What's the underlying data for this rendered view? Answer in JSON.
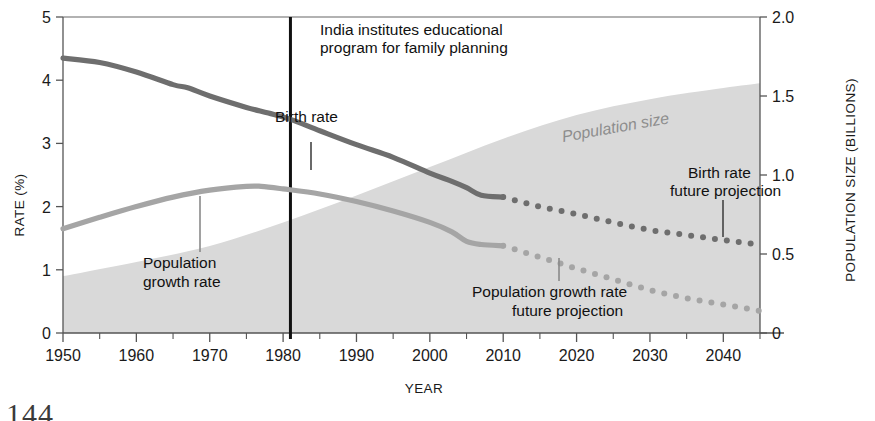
{
  "page": {
    "number": "144"
  },
  "chart_data": {
    "type": "line",
    "title": "",
    "xlabel": "YEAR",
    "ylabel": "RATE (%)",
    "y2label": "POPULATION SIZE (BILLIONS)",
    "xlim": [
      1950,
      2045
    ],
    "ylim": [
      0,
      5
    ],
    "y2lim": [
      0,
      2.0
    ],
    "grid": false,
    "legend_position": "inline-annotations",
    "xticks": [
      1950,
      1960,
      1970,
      1980,
      1990,
      2000,
      2010,
      2020,
      2030,
      2040
    ],
    "xticks_minor": [
      1955,
      1965,
      1975,
      1985,
      1995,
      2005,
      2015,
      2025,
      2035,
      2045
    ],
    "yticks": [
      0,
      1,
      2,
      3,
      4,
      5
    ],
    "y2ticks": [
      "0",
      "0.5",
      "1.0",
      "1.5",
      "2.0"
    ],
    "colors": {
      "birth_rate": "#6e6e6e",
      "growth_rate": "#a5a5a5",
      "population_area": "#d9d9d9",
      "event_line": "#111111",
      "axis": "#555555"
    },
    "annotations": [
      {
        "name": "event",
        "text_line1": "India institutes educational",
        "text_line2": "program for family planning",
        "year": 1981
      },
      {
        "name": "birth-rate",
        "text": "Birth rate"
      },
      {
        "name": "population-growth-rate",
        "text_line1": "Population",
        "text_line2": "growth rate"
      },
      {
        "name": "population-size",
        "text": "Population size"
      },
      {
        "name": "birth-rate-projection",
        "text_line1": "Birth rate",
        "text_line2": "future projection"
      },
      {
        "name": "population-growth-projection",
        "text_line1": "Population growth rate",
        "text_line2": "future projection"
      }
    ],
    "series": [
      {
        "name": "Birth rate",
        "axis": "left",
        "style": "solid",
        "x": [
          1950,
          1955,
          1960,
          1965,
          1967,
          1970,
          1975,
          1978,
          1981,
          1985,
          1990,
          1995,
          2000,
          2003,
          2005,
          2007,
          2010
        ],
        "values": [
          4.35,
          4.28,
          4.13,
          3.93,
          3.88,
          3.75,
          3.57,
          3.48,
          3.38,
          3.2,
          2.98,
          2.78,
          2.53,
          2.4,
          2.3,
          2.18,
          2.15
        ]
      },
      {
        "name": "Birth rate future projection",
        "axis": "left",
        "style": "dotted",
        "x": [
          2010,
          2015,
          2020,
          2025,
          2030,
          2035,
          2040,
          2045
        ],
        "values": [
          2.15,
          2.0,
          1.88,
          1.75,
          1.63,
          1.55,
          1.47,
          1.4
        ]
      },
      {
        "name": "Population growth rate",
        "axis": "left",
        "style": "solid",
        "x": [
          1950,
          1955,
          1960,
          1965,
          1970,
          1975,
          1977,
          1980,
          1985,
          1990,
          1995,
          2000,
          2003,
          2005,
          2007,
          2010
        ],
        "values": [
          1.65,
          1.83,
          2.0,
          2.15,
          2.26,
          2.32,
          2.32,
          2.28,
          2.2,
          2.08,
          1.93,
          1.75,
          1.6,
          1.45,
          1.4,
          1.38
        ]
      },
      {
        "name": "Population growth rate future projection",
        "axis": "left",
        "style": "dotted",
        "x": [
          2010,
          2015,
          2020,
          2025,
          2030,
          2035,
          2040,
          2045
        ],
        "values": [
          1.38,
          1.2,
          1.02,
          0.85,
          0.68,
          0.55,
          0.45,
          0.35
        ]
      },
      {
        "name": "Population size",
        "axis": "right",
        "style": "area",
        "x": [
          1950,
          1960,
          1970,
          1980,
          1990,
          2000,
          2010,
          2020,
          2030,
          2040,
          2045
        ],
        "values": [
          0.36,
          0.45,
          0.55,
          0.7,
          0.87,
          1.05,
          1.23,
          1.38,
          1.48,
          1.55,
          1.58
        ]
      }
    ]
  }
}
